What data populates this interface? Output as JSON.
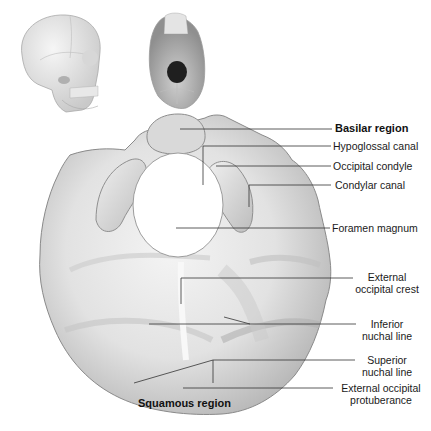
{
  "figure": {
    "thumbnails": [
      {
        "name": "skull-lateral-view",
        "description": "Lateral view of skull"
      },
      {
        "name": "skull-inferior-view",
        "description": "Inferior view of skull"
      }
    ]
  },
  "labels": {
    "basilar_region": "Basilar region",
    "hypoglossal_canal": "Hypoglossal canal",
    "occipital_condyle": "Occipital condyle",
    "condylar_canal": "Condylar canal",
    "foramen_magnum": "Foramen magnum",
    "external_occipital_crest_1": "External",
    "external_occipital_crest_2": "occipital crest",
    "inferior_nuchal_line_1": "Inferior",
    "inferior_nuchal_line_2": "nuchal line",
    "superior_nuchal_line_1": "Superior",
    "superior_nuchal_line_2": "nuchal line",
    "external_occipital_protuberance_1": "External occipital",
    "external_occipital_protuberance_2": "protuberance",
    "squamous_region": "Squamous region"
  },
  "colors": {
    "bone_light": "#efefef",
    "bone_mid": "#d4d4d4",
    "bone_dark": "#9a9a9a",
    "leader_line": "#333333",
    "text": "#1a1a1a"
  }
}
